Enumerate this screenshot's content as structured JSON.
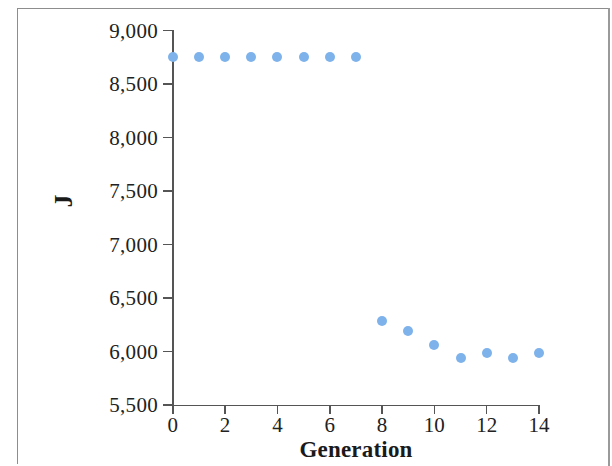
{
  "chart_data": {
    "type": "scatter",
    "title": "",
    "xlabel": "Generation",
    "ylabel": "J",
    "xlim": [
      0,
      14
    ],
    "ylim": [
      5500,
      9000
    ],
    "x_ticks": [
      0,
      2,
      4,
      6,
      8,
      10,
      12,
      14
    ],
    "x_tick_labels": [
      "0",
      "2",
      "4",
      "6",
      "8",
      "10",
      "12",
      "14"
    ],
    "y_ticks": [
      5500,
      6000,
      6500,
      7000,
      7500,
      8000,
      8500,
      9000
    ],
    "y_tick_labels": [
      "5,500",
      "6,000",
      "6,500",
      "7,000",
      "7,500",
      "8,000",
      "8,500",
      "9,000"
    ],
    "grid": false,
    "legend": null,
    "marker": "circle",
    "marker_color": "#7eb2ea",
    "axis_color": "#555555",
    "series": [
      {
        "name": "J",
        "x": [
          0,
          1,
          2,
          3,
          4,
          5,
          6,
          7,
          8,
          9,
          10,
          11,
          12,
          13,
          14
        ],
        "values": [
          8750,
          8750,
          8750,
          8750,
          8755,
          8755,
          8755,
          8755,
          6285,
          6190,
          6060,
          5940,
          5990,
          5940,
          5990
        ]
      }
    ]
  }
}
